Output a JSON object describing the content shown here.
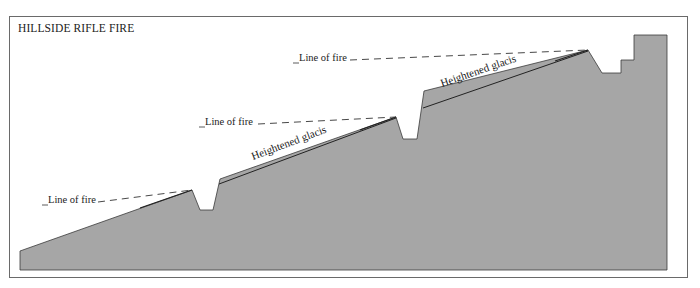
{
  "title": "HILLSIDE RIFLE FIRE",
  "colors": {
    "terrain_fill": "#a6a6a6",
    "outline": "#2a2a2a",
    "frame": "#6a6a6a",
    "background": "#ffffff"
  },
  "labels": {
    "line_of_fire_1": "Line of fire",
    "line_of_fire_2": "Line of fire",
    "line_of_fire_3": "Line of fire",
    "glacis_1": "Heightened glacis",
    "glacis_2": "Heightened glacis"
  },
  "positions": [
    {
      "name": "lower-trench",
      "line_of_fire": "Line of fire"
    },
    {
      "name": "middle-trench",
      "line_of_fire": "Line of fire",
      "glacis": "Heightened glacis"
    },
    {
      "name": "upper-trench",
      "line_of_fire": "Line of fire",
      "glacis": "Heightened glacis"
    }
  ]
}
